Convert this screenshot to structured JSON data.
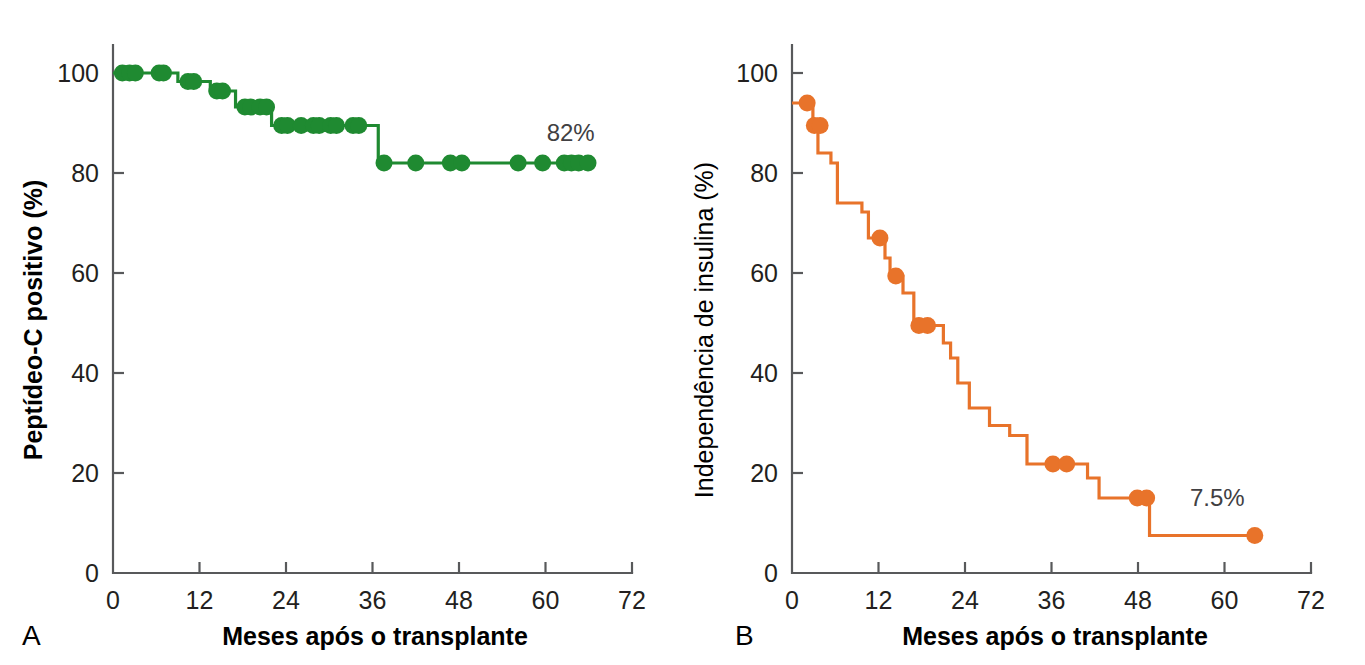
{
  "figure": {
    "panels": [
      {
        "letter": "A",
        "xlabel": "Meses após o transplante",
        "ylabel": "Peptídeo-C positivo (%)",
        "endpoint_label": "82%"
      },
      {
        "letter": "B",
        "xlabel": "Meses após o transplante",
        "ylabel": "Independência de insulina (%)",
        "endpoint_label": "7.5%"
      }
    ]
  },
  "chart_data": [
    {
      "type": "line",
      "subtype": "kaplan-meier-step",
      "panel": "A",
      "title": "Peptídeo-C positivo após o transplante",
      "xlabel": "Meses após o transplante",
      "ylabel": "Peptídeo-C positivo (%)",
      "xlim": [
        0,
        72
      ],
      "ylim": [
        0,
        100
      ],
      "xticks": [
        0,
        12,
        24,
        36,
        48,
        60,
        72
      ],
      "yticks": [
        0,
        20,
        40,
        60,
        80,
        100
      ],
      "grid": false,
      "legend": null,
      "color": "#1f8a31",
      "annotation": {
        "text": "82%",
        "x": 63.5,
        "y": 86.5
      },
      "steps": [
        {
          "x": 0,
          "y": 100
        },
        {
          "x": 9.0,
          "y": 100
        },
        {
          "x": 9.0,
          "y": 98.3
        },
        {
          "x": 13.5,
          "y": 98.3
        },
        {
          "x": 13.5,
          "y": 96.4
        },
        {
          "x": 17.0,
          "y": 96.4
        },
        {
          "x": 17.0,
          "y": 93.2
        },
        {
          "x": 22.0,
          "y": 93.2
        },
        {
          "x": 22.0,
          "y": 89.5
        },
        {
          "x": 36.8,
          "y": 89.5
        },
        {
          "x": 36.8,
          "y": 82.0
        },
        {
          "x": 66.5,
          "y": 82.0
        }
      ],
      "censored_points": [
        {
          "x": 1.3,
          "y": 100
        },
        {
          "x": 2.3,
          "y": 100
        },
        {
          "x": 3.1,
          "y": 100
        },
        {
          "x": 6.4,
          "y": 100
        },
        {
          "x": 7.0,
          "y": 100
        },
        {
          "x": 10.4,
          "y": 98.3
        },
        {
          "x": 11.2,
          "y": 98.3
        },
        {
          "x": 14.4,
          "y": 96.4
        },
        {
          "x": 15.2,
          "y": 96.4
        },
        {
          "x": 18.3,
          "y": 93.2
        },
        {
          "x": 19.1,
          "y": 93.2
        },
        {
          "x": 20.4,
          "y": 93.2
        },
        {
          "x": 21.3,
          "y": 93.2
        },
        {
          "x": 23.4,
          "y": 89.5
        },
        {
          "x": 24.2,
          "y": 89.5
        },
        {
          "x": 26.1,
          "y": 89.5
        },
        {
          "x": 27.8,
          "y": 89.5
        },
        {
          "x": 28.6,
          "y": 89.5
        },
        {
          "x": 30.2,
          "y": 89.5
        },
        {
          "x": 31.0,
          "y": 89.5
        },
        {
          "x": 33.3,
          "y": 89.5
        },
        {
          "x": 34.1,
          "y": 89.5
        },
        {
          "x": 37.6,
          "y": 82.0
        },
        {
          "x": 42.0,
          "y": 82.0
        },
        {
          "x": 46.8,
          "y": 82.0
        },
        {
          "x": 48.4,
          "y": 82.0
        },
        {
          "x": 56.2,
          "y": 82.0
        },
        {
          "x": 59.6,
          "y": 82.0
        },
        {
          "x": 62.6,
          "y": 82.0
        },
        {
          "x": 63.6,
          "y": 82.0
        },
        {
          "x": 64.6,
          "y": 82.0
        },
        {
          "x": 65.9,
          "y": 82.0
        }
      ]
    },
    {
      "type": "line",
      "subtype": "kaplan-meier-step",
      "panel": "B",
      "title": "Independência de insulina após o transplante",
      "xlabel": "Meses após o transplante",
      "ylabel": "Independência de insulina (%)",
      "xlim": [
        0,
        72
      ],
      "ylim": [
        0,
        100
      ],
      "xticks": [
        0,
        12,
        24,
        36,
        48,
        60,
        72
      ],
      "yticks": [
        0,
        20,
        40,
        60,
        80,
        100
      ],
      "grid": false,
      "legend": null,
      "color": "#e8732a",
      "annotation": {
        "text": "7.5%",
        "x": 59.0,
        "y": 13.5
      },
      "steps": [
        {
          "x": 0,
          "y": 94.0
        },
        {
          "x": 2.9,
          "y": 94.0
        },
        {
          "x": 2.9,
          "y": 89.5
        },
        {
          "x": 3.6,
          "y": 89.5
        },
        {
          "x": 3.6,
          "y": 84.0
        },
        {
          "x": 5.4,
          "y": 84.0
        },
        {
          "x": 5.4,
          "y": 82.0
        },
        {
          "x": 6.3,
          "y": 82.0
        },
        {
          "x": 6.3,
          "y": 74.0
        },
        {
          "x": 9.7,
          "y": 74.0
        },
        {
          "x": 9.7,
          "y": 72.2
        },
        {
          "x": 10.6,
          "y": 72.2
        },
        {
          "x": 10.6,
          "y": 67.0
        },
        {
          "x": 12.9,
          "y": 67.0
        },
        {
          "x": 12.9,
          "y": 63.0
        },
        {
          "x": 13.6,
          "y": 63.0
        },
        {
          "x": 13.6,
          "y": 59.4
        },
        {
          "x": 15.4,
          "y": 59.4
        },
        {
          "x": 15.4,
          "y": 56.0
        },
        {
          "x": 16.9,
          "y": 56.0
        },
        {
          "x": 16.9,
          "y": 49.5
        },
        {
          "x": 21.0,
          "y": 49.5
        },
        {
          "x": 21.0,
          "y": 46.0
        },
        {
          "x": 22.0,
          "y": 46.0
        },
        {
          "x": 22.0,
          "y": 43.0
        },
        {
          "x": 23.0,
          "y": 43.0
        },
        {
          "x": 23.0,
          "y": 38.0
        },
        {
          "x": 24.6,
          "y": 38.0
        },
        {
          "x": 24.6,
          "y": 33.0
        },
        {
          "x": 27.4,
          "y": 33.0
        },
        {
          "x": 27.4,
          "y": 29.5
        },
        {
          "x": 30.2,
          "y": 29.5
        },
        {
          "x": 30.2,
          "y": 27.5
        },
        {
          "x": 32.6,
          "y": 27.5
        },
        {
          "x": 32.6,
          "y": 21.8
        },
        {
          "x": 41.0,
          "y": 21.8
        },
        {
          "x": 41.0,
          "y": 19.0
        },
        {
          "x": 42.6,
          "y": 19.0
        },
        {
          "x": 42.6,
          "y": 15.0
        },
        {
          "x": 49.6,
          "y": 15.0
        },
        {
          "x": 49.6,
          "y": 7.5
        },
        {
          "x": 64.2,
          "y": 7.5
        }
      ],
      "censored_points": [
        {
          "x": 2.1,
          "y": 94.0
        },
        {
          "x": 3.1,
          "y": 89.5
        },
        {
          "x": 3.9,
          "y": 89.5
        },
        {
          "x": 12.2,
          "y": 67.0
        },
        {
          "x": 14.4,
          "y": 59.4
        },
        {
          "x": 17.6,
          "y": 49.5
        },
        {
          "x": 18.8,
          "y": 49.5
        },
        {
          "x": 36.2,
          "y": 21.8
        },
        {
          "x": 38.1,
          "y": 21.8
        },
        {
          "x": 47.9,
          "y": 15.0
        },
        {
          "x": 49.2,
          "y": 15.0
        },
        {
          "x": 64.2,
          "y": 7.5
        }
      ]
    }
  ]
}
